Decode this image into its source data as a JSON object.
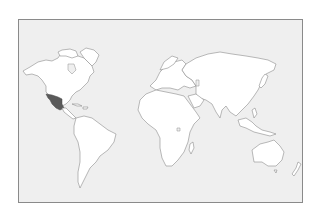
{
  "map": {
    "type": "world-outline",
    "highlighted_region": "Mexico",
    "colors": {
      "page_background": "#ffffff",
      "ocean": "#efefef",
      "land": "#ffffff",
      "outline": "#8c8c8c",
      "highlight": "#5a5a5a",
      "frame_border": "#8a8a8a"
    },
    "regions": [
      "North America",
      "Greenland",
      "Mexico",
      "Central America",
      "Caribbean",
      "South America",
      "Europe",
      "Africa",
      "Madagascar",
      "Asia",
      "Japan",
      "Southeast Asia",
      "Australia",
      "New Zealand"
    ]
  }
}
